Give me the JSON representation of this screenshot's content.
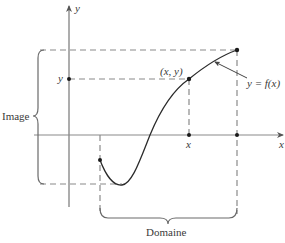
{
  "diagram": {
    "type": "function-domain-image",
    "colors": {
      "axis": "#8a8a8a",
      "curve": "#2b2b2b",
      "dashed": "#8a8a8a",
      "brace": "#6a6a6a",
      "text": "#3a3a3a",
      "point": "#1a1a1a"
    },
    "axes": {
      "x_label": "x",
      "y_label": "y"
    },
    "ticks": {
      "x_tick_label": "x",
      "y_tick_label": "y"
    },
    "point_label": "(x, y)",
    "curve_label": "y = f(x)",
    "image_label": "Image",
    "domain_label": "Domaine"
  }
}
